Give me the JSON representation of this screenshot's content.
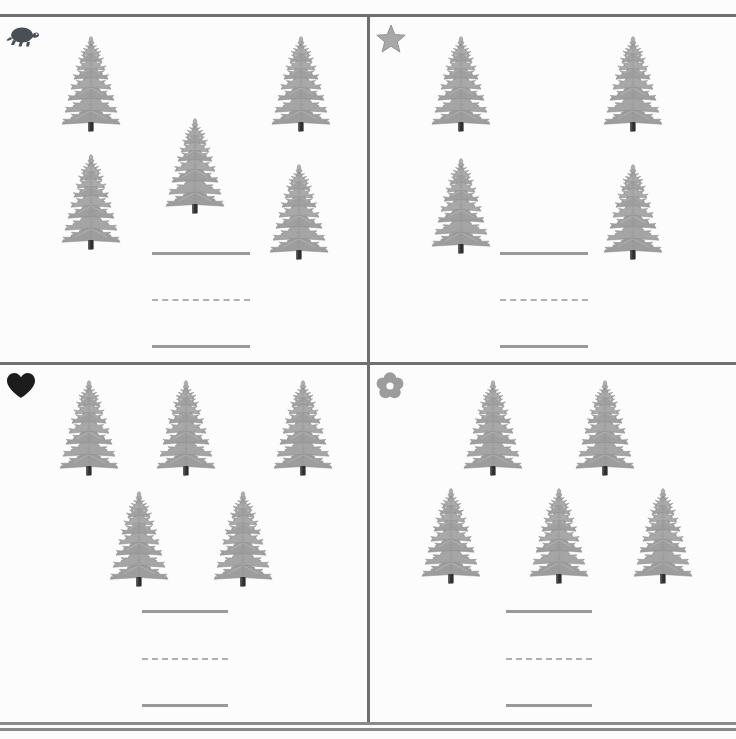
{
  "worksheet": {
    "title": "Counting Trees Worksheet",
    "background_color": "#fcfcfc",
    "rule_color": "#707070",
    "answer_line_color": "#9a9a9a",
    "page_width": 736,
    "page_height": 739
  },
  "quadrants": [
    {
      "id": "top-left",
      "marker_icon": "turtle-icon",
      "marker_color": "#4a4f57",
      "object_icon": "pine-tree-icon",
      "tree_count": 5,
      "trees": [
        {
          "x": 60,
          "y": 18
        },
        {
          "x": 270,
          "y": 18
        },
        {
          "x": 60,
          "y": 136
        },
        {
          "x": 164,
          "y": 100
        },
        {
          "x": 268,
          "y": 146
        }
      ],
      "answer_lines": [
        {
          "style": "solid",
          "x": 152,
          "y": 236,
          "width": 98
        },
        {
          "style": "dashed",
          "x": 152,
          "y": 283,
          "width": 98
        },
        {
          "style": "solid",
          "x": 152,
          "y": 329,
          "width": 98
        }
      ]
    },
    {
      "id": "top-right",
      "marker_icon": "star-icon",
      "marker_color": "#a8a8a8",
      "object_icon": "pine-tree-icon",
      "tree_count": 4,
      "trees": [
        {
          "x": 60,
          "y": 18
        },
        {
          "x": 232,
          "y": 18
        },
        {
          "x": 60,
          "y": 140
        },
        {
          "x": 232,
          "y": 146
        }
      ],
      "answer_lines": [
        {
          "style": "solid",
          "x": 130,
          "y": 236,
          "width": 88
        },
        {
          "style": "dashed",
          "x": 130,
          "y": 283,
          "width": 88
        },
        {
          "style": "solid",
          "x": 130,
          "y": 329,
          "width": 88
        }
      ]
    },
    {
      "id": "bottom-left",
      "marker_icon": "heart-icon",
      "marker_color": "#1c1c1c",
      "object_icon": "pine-tree-icon",
      "tree_count": 5,
      "trees": [
        {
          "x": 58,
          "y": 14
        },
        {
          "x": 155,
          "y": 14
        },
        {
          "x": 272,
          "y": 14
        },
        {
          "x": 108,
          "y": 125
        },
        {
          "x": 212,
          "y": 125
        }
      ],
      "answer_lines": [
        {
          "style": "solid",
          "x": 142,
          "y": 246,
          "width": 86
        },
        {
          "style": "dashed",
          "x": 142,
          "y": 294,
          "width": 86
        },
        {
          "style": "solid",
          "x": 142,
          "y": 340,
          "width": 86
        }
      ]
    },
    {
      "id": "bottom-right",
      "marker_icon": "flower-icon",
      "marker_color": "#9c9c9c",
      "object_icon": "pine-tree-icon",
      "tree_count": 5,
      "trees": [
        {
          "x": 92,
          "y": 14
        },
        {
          "x": 204,
          "y": 14
        },
        {
          "x": 50,
          "y": 122
        },
        {
          "x": 158,
          "y": 122
        },
        {
          "x": 262,
          "y": 122
        }
      ],
      "answer_lines": [
        {
          "style": "solid",
          "x": 136,
          "y": 246,
          "width": 86
        },
        {
          "style": "dashed",
          "x": 136,
          "y": 294,
          "width": 86
        },
        {
          "style": "solid",
          "x": 136,
          "y": 340,
          "width": 86
        }
      ]
    }
  ]
}
